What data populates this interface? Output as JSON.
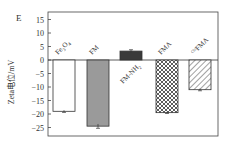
{
  "panel_label": "E",
  "chart_data": {
    "type": "bar",
    "title": "",
    "xlabel": "",
    "ylabel": "Zeta电位/mV",
    "ylim": [
      -28,
      18
    ],
    "yticks": [
      15,
      10,
      5,
      0,
      -5,
      -10,
      -15,
      -20,
      -25
    ],
    "categories": [
      "Fe3O4",
      "FM",
      "FM-NH2",
      "FMA",
      "Cbl-FMA"
    ],
    "category_labels": [
      {
        "main": "Fe",
        "sub1": "3",
        "mid": "O",
        "sub2": "4"
      },
      {
        "main": "FM"
      },
      {
        "main": "FM-NH",
        "sub1": "2"
      },
      {
        "main": "FMA"
      },
      {
        "pre": "Cbl",
        "main": "FMA"
      }
    ],
    "values": [
      -19.0,
      -24.5,
      3.3,
      -19.5,
      -11.0
    ],
    "errors": [
      0.4,
      0.8,
      0.5,
      0.3,
      0.4
    ],
    "fills": [
      "#ffffff",
      "#9a9a9a",
      "#3a3a3a",
      "crosshatch",
      "diagonal"
    ],
    "grid": false,
    "legend": null
  }
}
